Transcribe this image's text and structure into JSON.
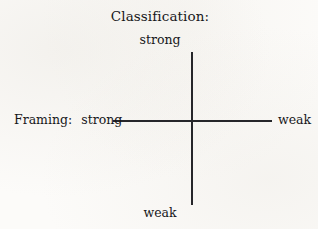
{
  "diagram": {
    "type": "two-axis-grid",
    "title": "Classification:",
    "vertical_axis": {
      "name": "Classification:",
      "top_label": "strong",
      "bottom_label": "weak"
    },
    "horizontal_axis": {
      "name": "Framing:",
      "left_label": "strong",
      "right_label": "weak"
    },
    "colors": {
      "line": "#26262a",
      "text": "#17171a",
      "background": "#fcfbf9"
    }
  }
}
